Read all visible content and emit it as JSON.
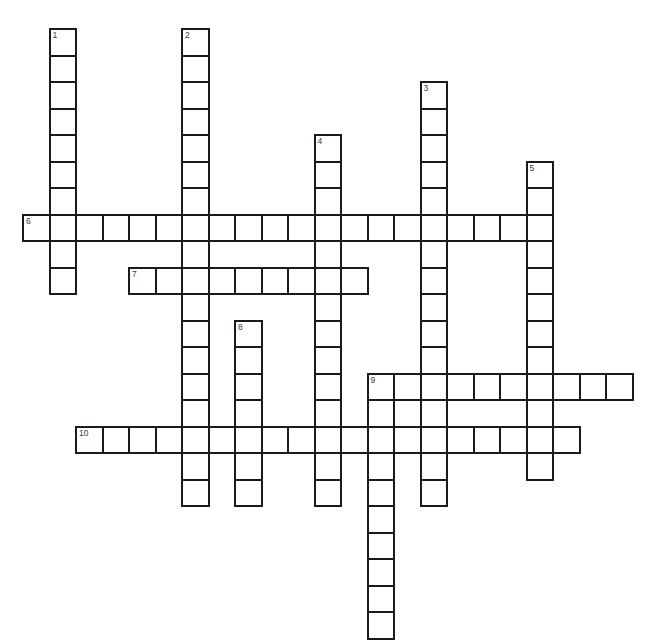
{
  "puzzle": {
    "title": "Crossword Grid",
    "cell_size": 26.5,
    "origin_x": 22,
    "origin_y": 28,
    "border_color": "#1a1a1a",
    "cell_fill": "#ffffff",
    "background": "#ffffff",
    "number_color": "#3a3a3a",
    "grid_columns": 24,
    "grid_rows": 23,
    "entries": [
      {
        "number": "1",
        "direction": "down",
        "col": 1,
        "row": 0,
        "length": 10
      },
      {
        "number": "2",
        "direction": "down",
        "col": 6,
        "row": 0,
        "length": 18
      },
      {
        "number": "3",
        "direction": "down",
        "col": 15,
        "row": 2,
        "length": 16
      },
      {
        "number": "4",
        "direction": "down",
        "col": 11,
        "row": 4,
        "length": 14
      },
      {
        "number": "5",
        "direction": "down",
        "col": 19,
        "row": 5,
        "length": 12
      },
      {
        "number": "6",
        "direction": "across",
        "col": 0,
        "row": 7,
        "length": 20
      },
      {
        "number": "7",
        "direction": "across",
        "col": 4,
        "row": 9,
        "length": 9
      },
      {
        "number": "8",
        "direction": "down",
        "col": 8,
        "row": 11,
        "length": 7
      },
      {
        "number": "9",
        "direction": "across",
        "col": 13,
        "row": 13,
        "length": 10
      },
      {
        "number": "9",
        "direction": "down",
        "col": 13,
        "row": 13,
        "length": 10
      },
      {
        "number": "10",
        "direction": "across",
        "col": 2,
        "row": 15,
        "length": 19
      }
    ],
    "numbered_labels": [
      "1",
      "2",
      "3",
      "4",
      "5",
      "6",
      "7",
      "8",
      "9",
      "10"
    ]
  }
}
